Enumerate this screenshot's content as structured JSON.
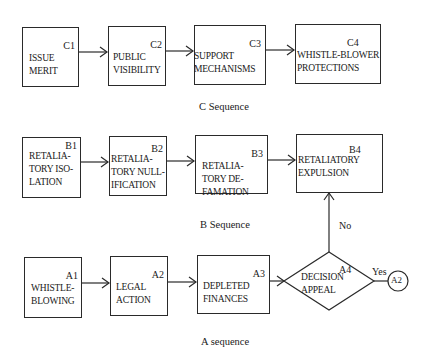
{
  "sequences": {
    "C": {
      "caption": "C Sequence",
      "nodes": [
        {
          "id": "C1",
          "label": "ISSUE\nMERIT"
        },
        {
          "id": "C2",
          "label": "PUBLIC\nVISIBILITY"
        },
        {
          "id": "C3",
          "label": "SUPPORT\nMECHANISMS"
        },
        {
          "id": "C4",
          "label": "WHISTLE-BLOWER\nPROTECTIONS"
        }
      ]
    },
    "B": {
      "caption": "B Sequence",
      "nodes": [
        {
          "id": "B1",
          "label": "RETALIA-\nTORY ISO-\nLATION"
        },
        {
          "id": "B2",
          "label": "RETALIA-\nTORY NULL-\nIFICATION"
        },
        {
          "id": "B3",
          "label": "RETALIA-\nTORY DE-\nFAMATION"
        },
        {
          "id": "B4",
          "label": "RETALIATORY\nEXPULSION"
        }
      ]
    },
    "A": {
      "caption": "A sequence",
      "nodes": [
        {
          "id": "A1",
          "label": "WHISTLE-\nBLOWING"
        },
        {
          "id": "A2",
          "label": "LEGAL\nACTION"
        },
        {
          "id": "A3",
          "label": "DEPLETED\nFINANCES"
        },
        {
          "id": "A4",
          "label": "DECISION\nAPPEAL",
          "shape": "diamond"
        }
      ]
    }
  },
  "decision": {
    "no_label": "No",
    "yes_label": "Yes",
    "yes_target": "A2"
  }
}
